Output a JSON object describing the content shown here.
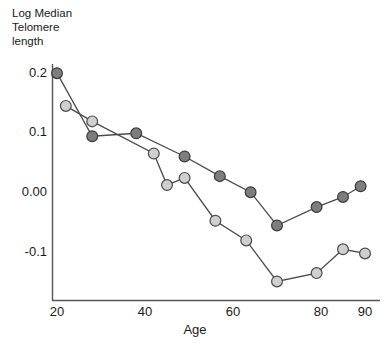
{
  "chart_data": {
    "type": "scatter",
    "title": "",
    "subtitle": "",
    "ylabel": "Log Median\nTelomere\nlength",
    "xlabel": "Age",
    "xlim": [
      18,
      92
    ],
    "ylim": [
      -0.175,
      0.215
    ],
    "grid": false,
    "legend": "none",
    "xticks": [
      "20",
      "40",
      "60",
      "80",
      "90"
    ],
    "xtick_values": [
      20,
      40,
      60,
      80,
      90
    ],
    "yticks": [
      "0.2",
      "0.1",
      "0.00",
      "-0.1"
    ],
    "ytick_values": [
      0.2,
      0.1,
      0.0,
      -0.1
    ],
    "series": [
      {
        "name": "dark-series",
        "marker": "filled-circle",
        "color": "#7d7d7d",
        "edge_color": "#3a3a3a",
        "line_color": "#4a4a4a",
        "x": [
          20,
          28,
          38,
          49,
          57,
          64,
          70,
          79,
          85,
          89
        ],
        "y": [
          0.198,
          0.092,
          0.097,
          0.058,
          0.025,
          -0.002,
          -0.058,
          -0.027,
          -0.01,
          0.008
        ]
      },
      {
        "name": "light-series",
        "marker": "open-circle",
        "color": "#cfcfcf",
        "edge_color": "#4a4a4a",
        "line_color": "#4a4a4a",
        "x": [
          22,
          28,
          42,
          45,
          49,
          56,
          63,
          70,
          79,
          85,
          90
        ],
        "y": [
          0.143,
          0.117,
          0.063,
          0.01,
          0.022,
          -0.05,
          -0.083,
          -0.152,
          -0.138,
          -0.098,
          -0.105
        ]
      }
    ]
  },
  "axis": {
    "line_color": "#555555",
    "y_axis_label_lines": [
      "Log Median",
      "Telomere",
      "length"
    ],
    "x_axis_title": "Age"
  }
}
